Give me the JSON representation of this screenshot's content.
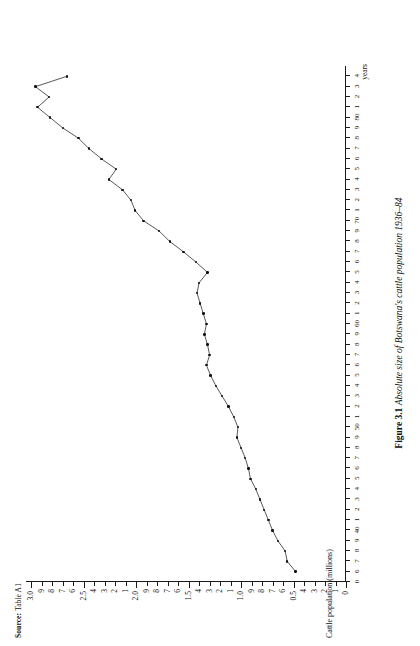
{
  "figure": {
    "number_label": "Figure 3.1",
    "title": "Absolute size of Botswana's cattle population 1936–84",
    "source_prefix": "Source:",
    "source_value": "Table A1"
  },
  "axes": {
    "y_axis_title": "Cattle population (millions)",
    "x_axis_unit": "years",
    "y_tick_labels": [
      "3.0",
      "9",
      "8",
      "7",
      "6",
      "2.5",
      "4",
      "3",
      "2",
      "1",
      "2.0",
      "9",
      "8",
      "7",
      "6",
      "1.5",
      "4",
      "3",
      "2",
      "1",
      "1.0",
      "9",
      "8",
      "7",
      "6",
      "0.5",
      "4",
      "3",
      "2",
      "1",
      "0"
    ],
    "x_tick_labels": [
      "0",
      "6",
      "7",
      "8",
      "9",
      "40",
      "1",
      "2",
      "3",
      "4",
      "5",
      "6",
      "7",
      "8",
      "9",
      "50",
      "1",
      "2",
      "3",
      "4",
      "5",
      "6",
      "7",
      "8",
      "9",
      "60",
      "1",
      "2",
      "3",
      "4",
      "5",
      "6",
      "7",
      "8",
      "9",
      "70",
      "1",
      "2",
      "3",
      "4",
      "5",
      "6",
      "7",
      "8",
      "9",
      "80",
      "1",
      "2",
      "3",
      "4"
    ]
  },
  "chart_data": {
    "type": "line",
    "title": "Absolute size of Botswana's cattle population 1936–84",
    "xlabel": "years",
    "ylabel": "Cattle population (millions)",
    "ylim": [
      0,
      3.05
    ],
    "xlim": [
      1935,
      1985
    ],
    "grid": false,
    "legend": "none",
    "marker": "filled-circle",
    "x": [
      1936,
      1937,
      1938,
      1939,
      1940,
      1941,
      1942,
      1943,
      1944,
      1945,
      1946,
      1947,
      1948,
      1949,
      1950,
      1951,
      1952,
      1953,
      1954,
      1955,
      1956,
      1957,
      1958,
      1959,
      1960,
      1961,
      1962,
      1963,
      1964,
      1965,
      1966,
      1967,
      1968,
      1969,
      1970,
      1971,
      1972,
      1973,
      1974,
      1975,
      1976,
      1977,
      1978,
      1979,
      1980,
      1981,
      1982,
      1983,
      1984
    ],
    "values": [
      0.48,
      0.56,
      0.58,
      0.65,
      0.7,
      0.74,
      0.78,
      0.82,
      0.86,
      0.91,
      0.93,
      0.96,
      1.0,
      1.04,
      1.03,
      1.07,
      1.12,
      1.18,
      1.24,
      1.29,
      1.33,
      1.3,
      1.32,
      1.35,
      1.33,
      1.36,
      1.39,
      1.42,
      1.4,
      1.32,
      1.43,
      1.55,
      1.68,
      1.78,
      1.93,
      2.01,
      2.05,
      2.13,
      2.26,
      2.19,
      2.33,
      2.45,
      2.55,
      2.7,
      2.82,
      2.94,
      2.83,
      2.96,
      2.66
    ],
    "annotations": [
      {
        "text": "Figure 3.1",
        "role": "figure-number"
      },
      {
        "text": "Source: Table A1",
        "role": "source-note"
      }
    ]
  }
}
